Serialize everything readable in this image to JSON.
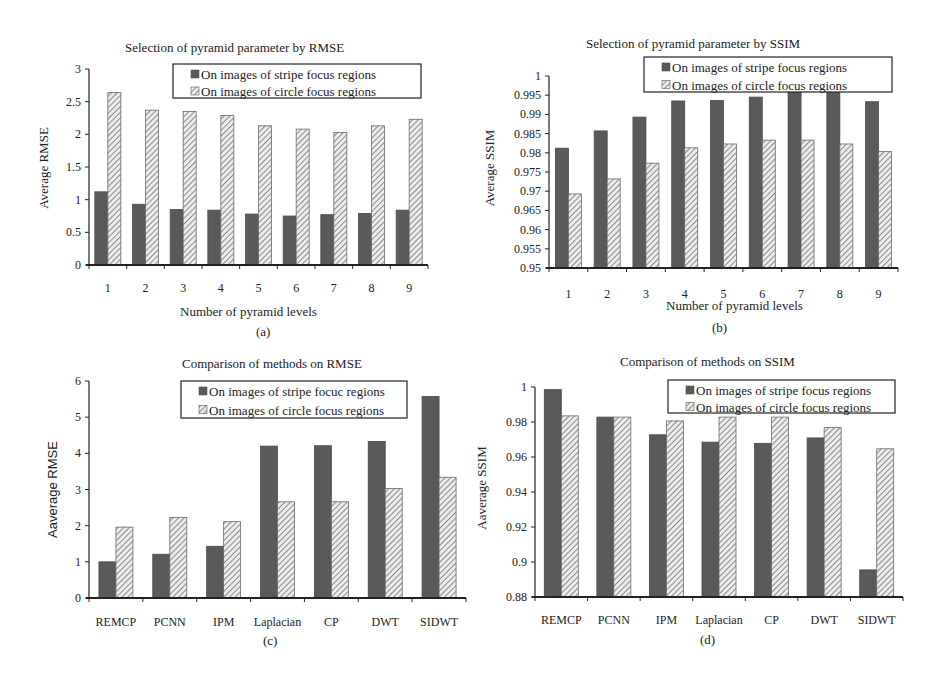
{
  "legend": {
    "series_a": "On images of stripe focus regions",
    "series_b": "On images of circle focus regions",
    "series_a_c": "On images of stripe focuc regions"
  },
  "colors": {
    "solid": "#5a5a5a",
    "hatch_bg": "#e8e8e8",
    "hatch_line": "#8a8a8a",
    "axis": "#222222"
  },
  "chart_data": [
    {
      "id": "a",
      "type": "bar",
      "title": "Selection of pyramid parameter by RMSE",
      "xlabel": "Number of pyramid levels",
      "ylabel": "Average RMSE",
      "caption": "(a)",
      "categories": [
        "1",
        "2",
        "3",
        "4",
        "5",
        "6",
        "7",
        "8",
        "9"
      ],
      "ylim": [
        0,
        3
      ],
      "yticks": [
        "0",
        "0.5",
        "1",
        "1.5",
        "2",
        "2.5",
        "3"
      ],
      "series": [
        {
          "name": "On images of stripe focus regions",
          "values": [
            1.12,
            0.93,
            0.85,
            0.84,
            0.78,
            0.75,
            0.77,
            0.79,
            0.84
          ]
        },
        {
          "name": "On images of circle focus regions",
          "values": [
            2.64,
            2.37,
            2.35,
            2.29,
            2.13,
            2.08,
            2.03,
            2.13,
            2.23
          ]
        }
      ],
      "grid": false,
      "legend_position": "top-right"
    },
    {
      "id": "b",
      "type": "bar",
      "title": "Selection of pyramid parameter by SSIM",
      "xlabel": "Number of pyramid levels",
      "ylabel": "Average SSIM",
      "caption": "(b)",
      "categories": [
        "1",
        "2",
        "3",
        "4",
        "5",
        "6",
        "7",
        "8",
        "9"
      ],
      "ylim": [
        0.95,
        1
      ],
      "yticks": [
        "0.95",
        "0.955",
        "0.96",
        "0.965",
        "0.97",
        "0.975",
        "0.98",
        "0.985",
        "0.99",
        "0.995",
        "1"
      ],
      "series": [
        {
          "name": "On images of stripe focus regions",
          "values": [
            0.9812,
            0.9857,
            0.9893,
            0.9935,
            0.9936,
            0.9945,
            0.996,
            0.9962,
            0.9933
          ]
        },
        {
          "name": "On images of circle focus regions",
          "values": [
            0.9693,
            0.9732,
            0.9773,
            0.9813,
            0.9823,
            0.9833,
            0.9833,
            0.9823,
            0.9803
          ]
        }
      ],
      "grid": false,
      "legend_position": "top-right"
    },
    {
      "id": "c",
      "type": "bar",
      "title": "Comparison of methods on RMSE",
      "xlabel": "",
      "ylabel": "Aaverage RMSE",
      "caption": "(c)",
      "categories": [
        "REMCP",
        "PCNN",
        "IPM",
        "Laplacian",
        "CP",
        "DWT",
        "SIDWT"
      ],
      "ylim": [
        0,
        6
      ],
      "yticks": [
        "0",
        "1",
        "2",
        "3",
        "4",
        "5",
        "6"
      ],
      "series": [
        {
          "name": "On images of stripe focuc regions",
          "values": [
            1.0,
            1.21,
            1.43,
            4.2,
            4.21,
            4.33,
            5.57
          ]
        },
        {
          "name": "On images of circle focus regions",
          "values": [
            1.96,
            2.23,
            2.11,
            2.66,
            2.66,
            3.03,
            3.34
          ]
        }
      ],
      "grid": false,
      "legend_position": "top-right"
    },
    {
      "id": "d",
      "type": "bar",
      "title": "Comparison of methods on SSIM",
      "xlabel": "",
      "ylabel": "Aaverage SSIM",
      "caption": "(d)",
      "categories": [
        "REMCP",
        "PCNN",
        "IPM",
        "Laplacian",
        "CP",
        "DWT",
        "SIDWT"
      ],
      "ylim": [
        0.88,
        1
      ],
      "yticks": [
        "0.88",
        "0.9",
        "0.92",
        "0.94",
        "0.96",
        "0.98",
        "1"
      ],
      "series": [
        {
          "name": "On images of stripe focus regions",
          "values": [
            0.9985,
            0.9828,
            0.9727,
            0.9685,
            0.9678,
            0.9709,
            0.8955
          ]
        },
        {
          "name": "On images of circle focus regions",
          "values": [
            0.9835,
            0.9828,
            0.9806,
            0.9828,
            0.9828,
            0.9768,
            0.9647
          ]
        }
      ],
      "grid": false,
      "legend_position": "top-right"
    }
  ]
}
